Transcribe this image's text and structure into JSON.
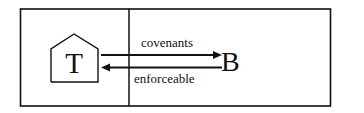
{
  "diagram": {
    "left_party": {
      "label": "T",
      "icon": "house-icon"
    },
    "right_party": {
      "label": "B"
    },
    "arrows": [
      {
        "id": "covenants",
        "label": "covenants",
        "direction": "T-to-B"
      },
      {
        "id": "enforceable",
        "label": "enforceable",
        "direction": "B-to-T"
      }
    ],
    "colors": {
      "stroke": "#111111",
      "background": "#ffffff"
    }
  }
}
